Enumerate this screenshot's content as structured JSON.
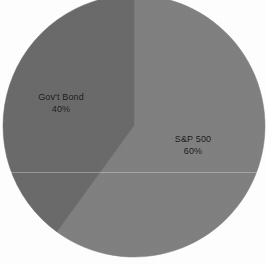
{
  "chart_data": {
    "type": "pie",
    "title": "",
    "subtitle": "",
    "xlabel": "",
    "ylabel": "",
    "legend_position": "none",
    "grid": false,
    "labels_inside_slices": true,
    "categories": [
      "S&P 500",
      "Gov't Bond"
    ],
    "values": [
      60,
      40
    ],
    "unit": "%",
    "slices": [
      {
        "name": "S&P 500",
        "label": "S&P 500",
        "value": 60,
        "value_label": "60%",
        "color": "#808080",
        "start_angle_deg": 0,
        "sweep_angle_deg": 216
      },
      {
        "name": "Gov't Bond",
        "label": "Gov't Bond",
        "value": 40,
        "value_label": "40%",
        "color": "#6a6a6a",
        "start_angle_deg": 216,
        "sweep_angle_deg": 144
      }
    ]
  },
  "geometry": {
    "center_x": 134,
    "center_y": 126,
    "radius": 131
  },
  "colors": {
    "background": "#ffffff",
    "sp500": "#808080",
    "gov_bond": "#6a6a6a",
    "label_text": "#161616",
    "divider": "#7a7a7a"
  }
}
